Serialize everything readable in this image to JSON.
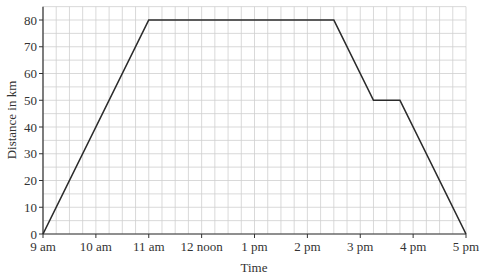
{
  "chart_data": {
    "type": "line",
    "title": "",
    "xlabel": "Time",
    "ylabel": "Distance in km",
    "x_tick_labels": [
      "9 am",
      "10 am",
      "11 am",
      "12 noon",
      "1 pm",
      "2 pm",
      "3 pm",
      "4 pm",
      "5 pm"
    ],
    "y_tick_labels": [
      "0",
      "10",
      "20",
      "30",
      "40",
      "50",
      "60",
      "70",
      "80"
    ],
    "xlim_hours_after_9am": [
      0,
      8
    ],
    "ylim": [
      0,
      85
    ],
    "grid": true,
    "minor_grid": {
      "x_step_minutes": 15,
      "y_step_km": 5
    },
    "legend": null,
    "series": [
      {
        "name": "Distance",
        "points": [
          {
            "time": "9:00 am",
            "hours": 0,
            "distance_km": 0
          },
          {
            "time": "11:00 am",
            "hours": 2,
            "distance_km": 80
          },
          {
            "time": "2:30 pm",
            "hours": 5.5,
            "distance_km": 80
          },
          {
            "time": "3:15 pm",
            "hours": 6.25,
            "distance_km": 50
          },
          {
            "time": "3:45 pm",
            "hours": 6.75,
            "distance_km": 50
          },
          {
            "time": "5:00 pm",
            "hours": 8,
            "distance_km": 0
          }
        ]
      }
    ],
    "colors": {
      "line": "#2b2b2b",
      "grid": "#cfcfcf",
      "axis": "#333333"
    }
  }
}
